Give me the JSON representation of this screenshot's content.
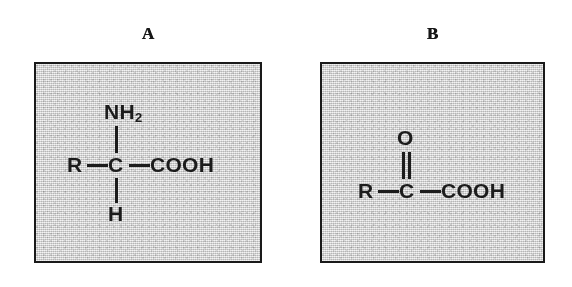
{
  "figure": {
    "background_color": "#ffffff",
    "panel_fill_color": "#d3d3d3",
    "panel_border_color": "#1a1a1a",
    "ink_color": "#1c1c1c"
  },
  "panels": [
    {
      "label": "A",
      "name": "amino-acid",
      "formula_plain": "R-C(NH2)(H)-COOH",
      "atoms": {
        "left_group": "R",
        "center": "C",
        "right_group": "COOH",
        "top_group": "NH",
        "top_group_subscript": "2",
        "bottom_group": "H"
      },
      "bonds": {
        "left": "single",
        "right": "single",
        "top": "single",
        "bottom": "single"
      }
    },
    {
      "label": "B",
      "name": "keto-acid",
      "formula_plain": "R-C(=O)-COOH",
      "atoms": {
        "left_group": "R",
        "center": "C",
        "right_group": "COOH",
        "top_group": "O"
      },
      "bonds": {
        "left": "single",
        "right": "single",
        "top": "double"
      }
    }
  ]
}
